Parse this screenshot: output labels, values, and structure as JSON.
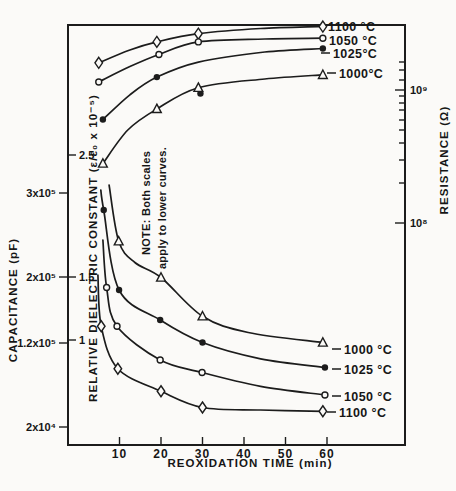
{
  "figure": {
    "background": "#fbfaf8",
    "ink": "#1c1c1c"
  },
  "axes": {
    "x": {
      "title": "REOXIDATION TIME (min)",
      "ticks": [
        "10",
        "20",
        "30",
        "40",
        "50",
        "60"
      ],
      "tick_t": [
        10,
        20,
        30,
        40,
        50,
        60
      ]
    },
    "capacitance": {
      "title": "CAPACITANCE (pF)",
      "ticks": [
        "3x10⁵",
        "2x10⁵",
        "1.2x10⁵",
        "2x10⁴"
      ],
      "tick_y": [
        193,
        277,
        343,
        427
      ]
    },
    "dielectric": {
      "title": "RELATIVE DIELECTRIC CONSTANT (ε/ε₀ x 10⁻⁵)",
      "ticks": [
        "2.5",
        "1.5",
        "1"
      ],
      "tick_y": [
        155,
        277,
        340
      ]
    },
    "resistance": {
      "title": "RESISTANCE (Ω)",
      "ticks": [
        "10⁹",
        "10⁸"
      ],
      "tick_y": [
        90,
        223
      ],
      "minor_tick_y": [
        62,
        70,
        80,
        96,
        103,
        110,
        120,
        130,
        143,
        160,
        183
      ]
    }
  },
  "note": {
    "line1": "NOTE: Both scales",
    "line2": "apply to lower curves."
  },
  "chart_data": {
    "type": "line",
    "xlabel": "REOXIDATION TIME (min)",
    "x_range_min": [
      0,
      79
    ],
    "upper_axis": "RESISTANCE (Ω), right log scale 10⁸–10⁹",
    "lower_axis": "RELATIVE DIELECTRIC CONSTANT (ε/ε₀ x 10⁻⁵) and CAPACITANCE (pF), left scales (NOTE: Both scales apply to lower curves.)",
    "upper_series": [
      {
        "label": "1100 °C",
        "marker": "diamond",
        "t": [
          5,
          12.5,
          19,
          29,
          44,
          59
        ],
        "resistance_ohm": [
          1600000000.0,
          2000000000.0,
          2300000000.0,
          2650000000.0,
          2900000000.0,
          3000000000.0
        ],
        "marker_idx": [
          0,
          2,
          3,
          5
        ],
        "label_px": [
          328,
          26
        ],
        "dash": false
      },
      {
        "label": "1050 °C",
        "marker": "circle",
        "t": [
          5,
          12.5,
          19.5,
          29,
          45,
          59
        ],
        "resistance_ohm": [
          1150000000.0,
          1500000000.0,
          1850000000.0,
          2300000000.0,
          2420000000.0,
          2450000000.0
        ],
        "marker_idx": [
          0,
          2,
          3,
          5
        ],
        "label_px": [
          329,
          40
        ],
        "dash": false
      },
      {
        "label": "1025°C",
        "marker": "dot",
        "t": [
          6,
          12.5,
          19,
          29,
          45,
          59
        ],
        "resistance_ohm": [
          600000000.0,
          920000000.0,
          1250000000.0,
          1620000000.0,
          1930000000.0,
          2050000000.0
        ],
        "marker_idx": [
          0,
          2,
          5
        ],
        "extra_markers_t": [
          29.5
        ],
        "extra_markers_val": [
          940000000.0
        ],
        "label_px": [
          333,
          53
        ],
        "dash": true
      },
      {
        "label": "1000°C",
        "marker": "triangle",
        "t": [
          6,
          12,
          19,
          29,
          45,
          59
        ],
        "resistance_ohm": [
          280000000.0,
          500000000.0,
          720000000.0,
          1040000000.0,
          1210000000.0,
          1300000000.0
        ],
        "marker_idx": [
          0,
          2,
          3,
          5
        ],
        "label_px": [
          339,
          73
        ],
        "dash": true
      }
    ],
    "lower_series": [
      {
        "label": "1000 °C",
        "marker": "triangle",
        "t": [
          7.5,
          9.8,
          13.7,
          20,
          30,
          41,
          59
        ],
        "eps_rel": [
          2.24,
          1.79,
          1.62,
          1.5,
          1.19,
          1.06,
          0.98
        ],
        "marker_idx": [
          1,
          3,
          4,
          6
        ],
        "label_px": [
          344,
          349
        ],
        "dash": true
      },
      {
        "label": "1025 °C",
        "marker": "dot",
        "t": [
          5.5,
          6.2,
          9.9,
          19.8,
          30,
          44,
          59.5
        ],
        "eps_rel": [
          2.2,
          2.04,
          1.4,
          1.16,
          0.98,
          0.85,
          0.78
        ],
        "marker_idx": [
          1,
          2,
          3,
          4,
          6
        ],
        "label_px": [
          344,
          369
        ],
        "dash": true
      },
      {
        "label": "1050 °C",
        "marker": "circle",
        "t": [
          6,
          6.9,
          9.4,
          19.8,
          29.9,
          44,
          59.5
        ],
        "eps_rel": [
          1.8,
          1.42,
          1.11,
          0.84,
          0.74,
          0.63,
          0.56
        ],
        "marker_idx": [
          1,
          2,
          3,
          4,
          6
        ],
        "label_px": [
          344,
          396
        ],
        "dash": true
      },
      {
        "label": "1100 °C",
        "marker": "diamond",
        "t": [
          4.8,
          5.6,
          9.6,
          20,
          30,
          44,
          59
        ],
        "eps_rel": [
          1.52,
          1.11,
          0.77,
          0.59,
          0.46,
          0.44,
          0.43
        ],
        "marker_idx": [
          1,
          2,
          3,
          4,
          6
        ],
        "label_px": [
          339,
          412
        ],
        "dash": true
      }
    ]
  },
  "layout": {
    "plot": {
      "left": 68,
      "top": 25,
      "right": 405,
      "bottom": 445
    },
    "x0": 78,
    "px_per_min": 4.15,
    "eps1_y": 340,
    "px_per_eps": 125,
    "r9_y": 90,
    "px_per_decade": 133
  }
}
